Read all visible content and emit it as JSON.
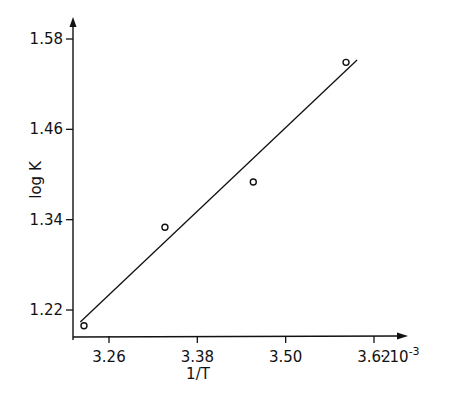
{
  "chart_data": {
    "type": "scatter",
    "title": "",
    "xlabel": "1/T",
    "ylabel": "log K",
    "x_multiplier_label": "· 10",
    "x_multiplier_exp": "-3",
    "x_ticks": [
      "3.26",
      "3.38",
      "3.50",
      "3.62"
    ],
    "y_ticks": [
      "1.22",
      "1.34",
      "1.46",
      "1.58"
    ],
    "xlim": [
      3.225,
      3.665
    ],
    "ylim": [
      1.185,
      1.605
    ],
    "grid": false,
    "legend": null,
    "series": [
      {
        "name": "measured",
        "marker": "open-circle",
        "x": [
          3.226,
          3.336,
          3.456,
          3.582
        ],
        "y": [
          1.199,
          1.33,
          1.39,
          1.549
        ]
      },
      {
        "name": "linear fit",
        "marker": "line",
        "x": [
          3.221,
          3.597
        ],
        "y": [
          1.204,
          1.552
        ]
      }
    ]
  }
}
